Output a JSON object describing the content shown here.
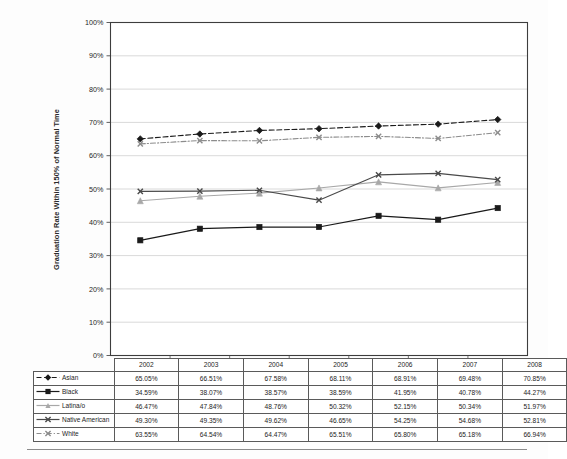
{
  "chart_data": {
    "type": "line",
    "title": "",
    "xlabel": "",
    "ylabel": "Graduation Rate Within 150% of Normal Time",
    "ylim": [
      0,
      100
    ],
    "ytick_labels": [
      "100%",
      "90%",
      "80%",
      "70%",
      "60%",
      "50%",
      "40%",
      "30%",
      "20%",
      "10%",
      "0%"
    ],
    "ytick_values": [
      100,
      90,
      80,
      70,
      60,
      50,
      40,
      30,
      20,
      10,
      0
    ],
    "grid": true,
    "legend_position": "table-left",
    "categories": [
      "2002",
      "2003",
      "2004",
      "2005",
      "2006",
      "2007",
      "2008"
    ],
    "series": [
      {
        "name": "Asian",
        "values": [
          65.05,
          66.51,
          67.58,
          68.11,
          68.91,
          69.48,
          70.85
        ],
        "labels": [
          "65.05%",
          "66.51%",
          "67.58%",
          "68.11%",
          "68.91%",
          "69.48%",
          "70.85%"
        ],
        "color": "#1a1a1a",
        "line_style": "dashed",
        "marker": "diamond"
      },
      {
        "name": "Black",
        "values": [
          34.59,
          38.07,
          38.57,
          38.59,
          41.95,
          40.78,
          44.27
        ],
        "labels": [
          "34.59%",
          "38.07%",
          "38.57%",
          "38.59%",
          "41.95%",
          "40.78%",
          "44.27%"
        ],
        "color": "#1a1a1a",
        "line_style": "solid",
        "marker": "square"
      },
      {
        "name": "Latina/o",
        "values": [
          46.47,
          47.84,
          48.76,
          50.32,
          52.15,
          50.34,
          51.97
        ],
        "labels": [
          "46.47%",
          "47.84%",
          "48.76%",
          "50.32%",
          "52.15%",
          "50.34%",
          "51.97%"
        ],
        "color": "#a8a8a8",
        "line_style": "solid",
        "marker": "triangle"
      },
      {
        "name": "Native American",
        "values": [
          49.3,
          49.35,
          49.62,
          46.65,
          54.25,
          54.68,
          52.81
        ],
        "labels": [
          "49.30%",
          "49.35%",
          "49.62%",
          "46.65%",
          "54.25%",
          "54.68%",
          "52.81%"
        ],
        "color": "#4a4a4a",
        "line_style": "solid",
        "marker": "x"
      },
      {
        "name": "White",
        "values": [
          63.55,
          64.54,
          64.47,
          65.51,
          65.8,
          65.18,
          66.94
        ],
        "labels": [
          "63.55%",
          "64.54%",
          "64.47%",
          "65.51%",
          "65.80%",
          "65.18%",
          "66.94%"
        ],
        "color": "#8c8c8c",
        "line_style": "dashdot",
        "marker": "x"
      }
    ]
  },
  "colors": {
    "gridline": "#cfcfcf",
    "axis": "#4d4d4d",
    "plot_border": "#3d3d3d",
    "table_border": "#5a5a5a",
    "background": "#fdfdfd"
  }
}
